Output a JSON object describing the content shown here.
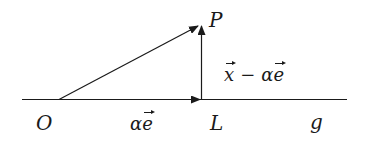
{
  "diagram": {
    "type": "vector-decomposition",
    "colors": {
      "line": "#1a1a1a",
      "background": "#ffffff"
    },
    "points": {
      "O": {
        "label": "O"
      },
      "P": {
        "label": "P"
      },
      "L": {
        "label": "L"
      }
    },
    "line_label": "g",
    "vectors": {
      "OL": {
        "symbol": "α",
        "vec": "e"
      },
      "LP": {
        "vec1": "x",
        "op": "−",
        "coef": "α",
        "vec2": "e"
      }
    }
  }
}
